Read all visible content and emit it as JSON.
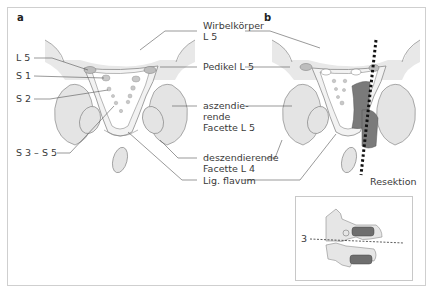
{
  "panels": {
    "a": {
      "letter": "a"
    },
    "b": {
      "letter": "b"
    }
  },
  "labels_left": {
    "l5": "L 5",
    "s1": "S 1",
    "s2": "S 2",
    "s3_s5": "S 3 – S 5"
  },
  "labels_center": {
    "wirbelkoerper_line1": "Wirbelkörper",
    "wirbelkoerper_line2": "L 5",
    "pedikel": "Pedikel L 5",
    "aszendierende_line1": "aszendie-",
    "aszendierende_line2": "rende",
    "aszendierende_line3": "Facette L 5",
    "deszendierende_line1": "deszendierende",
    "deszendierende_line2": "Facette L 4",
    "lig_flavum": "Lig. flavum"
  },
  "labels_right": {
    "resektion": "Resektion"
  },
  "inset": {
    "level_label": "3"
  },
  "colors": {
    "bone_fill": "#e6e6e6",
    "outline": "#8a8a8a",
    "resection_dark": "#7a7a7a",
    "leader_line": "#555555",
    "frame": "#cfcfcf"
  }
}
